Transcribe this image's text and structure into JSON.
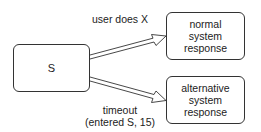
{
  "diagram": {
    "type": "state-transition",
    "nodes": [
      {
        "id": "S",
        "label": "S"
      },
      {
        "id": "normal",
        "label": "normal\nsystem\nresponse"
      },
      {
        "id": "alternative",
        "label": "alternative\nsystem\nresponse"
      }
    ],
    "edges": [
      {
        "from": "S",
        "to": "normal",
        "label": "user does X",
        "style": "double-line-arrow"
      },
      {
        "from": "S",
        "to": "alternative",
        "label": "timeout\n(entered S, 15)",
        "style": "double-line-arrow"
      }
    ],
    "colors": {
      "stroke": "#333333",
      "text": "#222222",
      "background": "#ffffff"
    }
  }
}
